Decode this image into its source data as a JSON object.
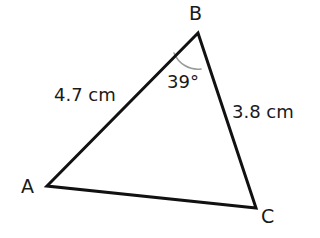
{
  "diagram": {
    "kind": "triangle-diagram",
    "background_color": "#ffffff",
    "stroke_color": "#111111",
    "arc_color": "#9a9a9a",
    "stroke_width": 3,
    "vertices": [
      {
        "name": "A",
        "label": "A",
        "x": 47,
        "y": 186
      },
      {
        "name": "B",
        "label": "B",
        "x": 198,
        "y": 33
      },
      {
        "name": "C",
        "label": "C",
        "x": 256,
        "y": 208
      }
    ],
    "sides": [
      {
        "name": "AB",
        "from": "A",
        "to": "B",
        "label": "4.7 cm"
      },
      {
        "name": "BC",
        "from": "B",
        "to": "C",
        "label": "3.8 cm"
      },
      {
        "name": "AC",
        "from": "A",
        "to": "C",
        "label": ""
      }
    ],
    "angles": [
      {
        "at": "B",
        "label": "39°",
        "value": 39,
        "unit": "degrees"
      }
    ],
    "angle_arc": {
      "at": "B",
      "start_x": 174,
      "start_y": 53,
      "end_x": 201,
      "end_y": 69,
      "radius": 26
    }
  }
}
